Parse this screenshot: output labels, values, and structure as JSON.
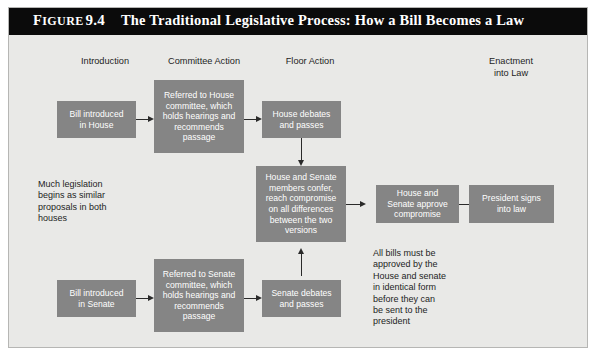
{
  "figure": {
    "label": "Figure",
    "number": "9.4",
    "title": "The Traditional Legislative Process: How a Bill Becomes a Law"
  },
  "columns": [
    {
      "id": "introduction",
      "label": "Introduction"
    },
    {
      "id": "committee-action",
      "label": "Committee Action"
    },
    {
      "id": "floor-action",
      "label": "Floor Action"
    },
    {
      "id": "enactment-into-law",
      "label": "Enactment\ninto Law"
    }
  ],
  "nodes": [
    {
      "id": "bill-introduced-in-house",
      "label": "Bill introduced\nin House"
    },
    {
      "id": "referred-to-house-committee",
      "label": "Referred to House\ncommittee, which\nholds hearings and\nrecommends\npassage"
    },
    {
      "id": "house-debates-and-passes",
      "label": "House debates\nand passes"
    },
    {
      "id": "conference-committee",
      "label": "House and Senate\nmembers confer,\nreach compromise\non all differences\nbetween the two\nversions"
    },
    {
      "id": "house-and-senate-approve-compromise",
      "label": "House and\nSenate approve\ncompromise"
    },
    {
      "id": "president-signs-into-law",
      "label": "President signs\ninto law"
    },
    {
      "id": "bill-introduced-in-senate",
      "label": "Bill introduced\nin Senate"
    },
    {
      "id": "referred-to-senate-committee",
      "label": "Referred to Senate\ncommittee, which\nholds hearings and\nrecommends\npassage"
    },
    {
      "id": "senate-debates-and-passes",
      "label": "Senate debates\nand passes"
    }
  ],
  "notes": [
    {
      "id": "much-legislation-note",
      "text": "Much legislation\nbegins as similar\nproposals in both\nhouses"
    },
    {
      "id": "identical-form-note",
      "text": "All bills must be\napproved by the\nHouse and senate\nin identical form\nbefore they can\nbe sent to the\npresident"
    }
  ],
  "colors": {
    "title_bar": "#0b0b0b",
    "title_text": "#ffffff",
    "panel_background": "#e9e9e7",
    "node_fill": "#858585",
    "node_text": "#ffffff",
    "connector": "#2a2a2a",
    "body_text": "#1d1d1d"
  }
}
